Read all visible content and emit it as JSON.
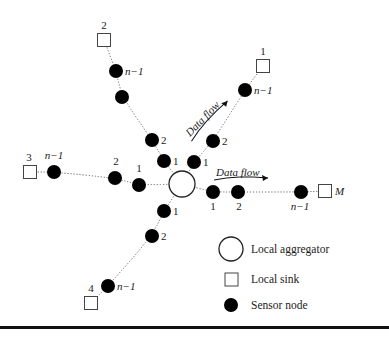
{
  "diagram": {
    "type": "sensor-network-topology",
    "aggregator": {
      "cx": 182,
      "cy": 184,
      "r": 13
    },
    "branches": [
      {
        "id": "branch-1",
        "sink": {
          "x": 263,
          "y": 66,
          "label": "1",
          "lx": 263,
          "ly": 55,
          "anchor": "middle"
        },
        "nodes": [
          {
            "x": 194,
            "y": 162,
            "label": "1",
            "lx": 203,
            "ly": 166
          },
          {
            "x": 213,
            "y": 141,
            "label": "2",
            "lx": 222,
            "ly": 145
          },
          {
            "x": 245,
            "y": 90,
            "label": "n−1",
            "lx": 254,
            "ly": 94
          }
        ]
      },
      {
        "id": "branch-2",
        "sink": {
          "x": 104,
          "y": 40,
          "label": "2",
          "lx": 104,
          "ly": 29,
          "anchor": "middle"
        },
        "nodes": [
          {
            "x": 164,
            "y": 161,
            "label": "1",
            "lx": 173,
            "ly": 165
          },
          {
            "x": 152,
            "y": 140,
            "label": "2",
            "lx": 161,
            "ly": 144
          },
          {
            "x": 122,
            "y": 97,
            "label": "",
            "lx": 0,
            "ly": 0
          },
          {
            "x": 116,
            "y": 71,
            "label": "n−1",
            "lx": 125,
            "ly": 75
          }
        ]
      },
      {
        "id": "branch-3",
        "sink": {
          "x": 30,
          "y": 172,
          "label": "3",
          "lx": 29,
          "ly": 161,
          "anchor": "middle"
        },
        "nodes": [
          {
            "x": 139,
            "y": 185,
            "label": "1",
            "lx": 139,
            "ly": 172,
            "anchor": "middle"
          },
          {
            "x": 115,
            "y": 178,
            "label": "2",
            "lx": 116,
            "ly": 165,
            "anchor": "middle"
          },
          {
            "x": 54,
            "y": 172,
            "label": "n−1",
            "lx": 54,
            "ly": 159,
            "anchor": "middle"
          }
        ]
      },
      {
        "id": "branch-4",
        "sink": {
          "x": 91,
          "y": 303,
          "label": "4",
          "lx": 91,
          "ly": 292,
          "anchor": "middle"
        },
        "nodes": [
          {
            "x": 164,
            "y": 211,
            "label": "1",
            "lx": 173,
            "ly": 215
          },
          {
            "x": 152,
            "y": 236,
            "label": "2",
            "lx": 161,
            "ly": 240
          },
          {
            "x": 108,
            "y": 286,
            "label": "n−1",
            "lx": 117,
            "ly": 290
          }
        ]
      },
      {
        "id": "branch-M",
        "sink": {
          "x": 325,
          "y": 191,
          "label": "M",
          "lx": 335,
          "ly": 195,
          "anchor": "start",
          "italic": true
        },
        "nodes": [
          {
            "x": 213,
            "y": 192,
            "label": "1",
            "lx": 213,
            "ly": 210,
            "anchor": "middle"
          },
          {
            "x": 238,
            "y": 192,
            "label": "2",
            "lx": 239,
            "ly": 210,
            "anchor": "middle"
          },
          {
            "x": 301,
            "y": 192,
            "label": "n−1",
            "lx": 300,
            "ly": 210,
            "anchor": "middle"
          }
        ]
      }
    ],
    "flow_labels": [
      {
        "id": "flow-diagonal",
        "text": "Data flow",
        "x": 190,
        "y": 137,
        "rotate": -46
      },
      {
        "id": "flow-horizontal",
        "text": "Data flow",
        "x": 216,
        "y": 176,
        "rotate": 0
      }
    ],
    "legend": {
      "items": [
        {
          "symbol": "circle",
          "label": "Local aggregator"
        },
        {
          "symbol": "square",
          "label": "Local sink"
        },
        {
          "symbol": "dot",
          "label": "Sensor node"
        }
      ]
    },
    "colors": {
      "node": "#000000",
      "link": "#666666",
      "background": "#ffffff"
    }
  }
}
